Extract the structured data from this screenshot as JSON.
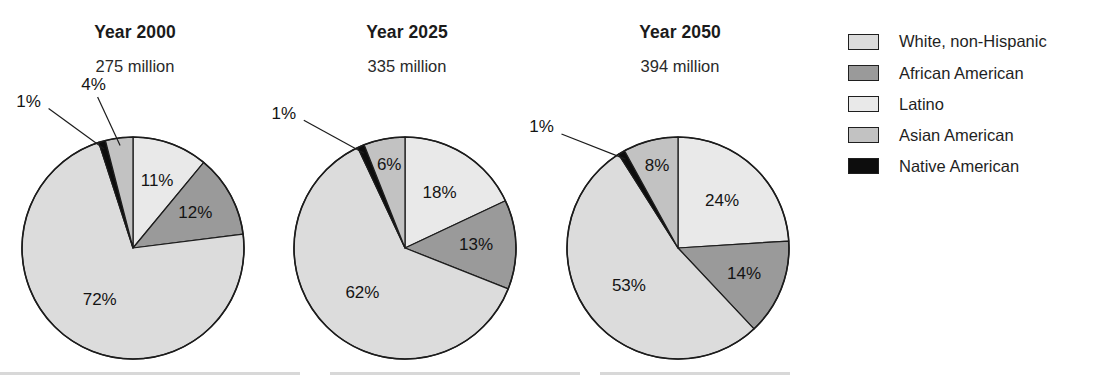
{
  "chart_data": {
    "type": "pie",
    "title": "",
    "subtitle": "",
    "legend_position": "right",
    "categories": [
      "White, non-Hispanic",
      "African American",
      "Latino",
      "Asian American",
      "Native American"
    ],
    "colors": {
      "White, non-Hispanic": "#dcdcdc",
      "African American": "#9a9a9a",
      "Latino": "#e9e9e9",
      "Asian American": "#c2c2c2",
      "Native American": "#0d0d0d"
    },
    "charts": [
      {
        "title": "Year 2000",
        "subtitle": "275 million",
        "total_population": "275 million",
        "slices": [
          {
            "label": "Latino",
            "value": 11,
            "display": "11%",
            "color": "#e9e9e9",
            "inside": true
          },
          {
            "label": "African American",
            "value": 12,
            "display": "12%",
            "color": "#9a9a9a",
            "inside": true
          },
          {
            "label": "White, non-Hispanic",
            "value": 72,
            "display": "72%",
            "color": "#dcdcdc",
            "inside": true
          },
          {
            "label": "Native American",
            "value": 1,
            "display": "1%",
            "color": "#0d0d0d",
            "inside": false
          },
          {
            "label": "Asian American",
            "value": 4,
            "display": "4%",
            "color": "#c2c2c2",
            "inside": false
          }
        ]
      },
      {
        "title": "Year 2025",
        "subtitle": "335 million",
        "total_population": "335 million",
        "slices": [
          {
            "label": "Latino",
            "value": 18,
            "display": "18%",
            "color": "#e9e9e9",
            "inside": true
          },
          {
            "label": "African American",
            "value": 13,
            "display": "13%",
            "color": "#9a9a9a",
            "inside": true
          },
          {
            "label": "White, non-Hispanic",
            "value": 62,
            "display": "62%",
            "color": "#dcdcdc",
            "inside": true
          },
          {
            "label": "Native American",
            "value": 1,
            "display": "1%",
            "color": "#0d0d0d",
            "inside": false
          },
          {
            "label": "Asian American",
            "value": 6,
            "display": "6%",
            "color": "#c2c2c2",
            "inside": true
          }
        ]
      },
      {
        "title": "Year 2050",
        "subtitle": "394 million",
        "total_population": "394 million",
        "slices": [
          {
            "label": "Latino",
            "value": 24,
            "display": "24%",
            "color": "#e9e9e9",
            "inside": true
          },
          {
            "label": "African American",
            "value": 14,
            "display": "14%",
            "color": "#9a9a9a",
            "inside": true
          },
          {
            "label": "White, non-Hispanic",
            "value": 53,
            "display": "53%",
            "color": "#dcdcdc",
            "inside": true
          },
          {
            "label": "Native American",
            "value": 1,
            "display": "1%",
            "color": "#0d0d0d",
            "inside": false
          },
          {
            "label": "Asian American",
            "value": 8,
            "display": "8%",
            "color": "#c2c2c2",
            "inside": true
          }
        ]
      }
    ]
  },
  "legend": {
    "items": [
      {
        "label": "White, non-Hispanic",
        "color": "#dcdcdc"
      },
      {
        "label": "African American",
        "color": "#9a9a9a"
      },
      {
        "label": "Latino",
        "color": "#e9e9e9"
      },
      {
        "label": "Asian American",
        "color": "#c2c2c2"
      },
      {
        "label": "Native American",
        "color": "#0d0d0d"
      }
    ]
  }
}
